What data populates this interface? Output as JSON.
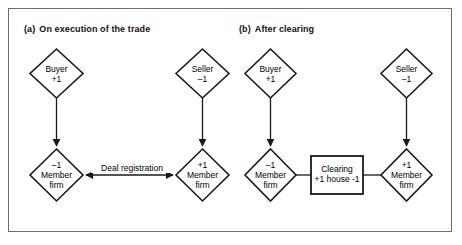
{
  "figure": {
    "width": 462,
    "height": 245,
    "border_color": "#6d6d6d",
    "line_color": "#1a1a1a",
    "background": "#ffffff"
  },
  "panels": [
    {
      "id": "a",
      "tag": "(a)",
      "title": "On execution of the trade",
      "nodes": [
        {
          "id": "buyer",
          "shape": "diamond",
          "line1": "Buyer",
          "line2": "+1"
        },
        {
          "id": "seller",
          "shape": "diamond",
          "line1": "Seller",
          "line2": "–1"
        },
        {
          "id": "buyer_member_firm",
          "shape": "diamond",
          "line1": "–1",
          "line2": "Member",
          "line3": "firm"
        },
        {
          "id": "seller_member_firm",
          "shape": "diamond",
          "line1": "+1",
          "line2": "Member",
          "line3": "firm"
        }
      ],
      "edges": [
        {
          "id": "buyer-to-member",
          "from": "buyer",
          "to": "buyer_member_firm",
          "arrows": "end",
          "label": ""
        },
        {
          "id": "seller-to-member",
          "from": "seller",
          "to": "seller_member_firm",
          "arrows": "end",
          "label": ""
        },
        {
          "id": "deal-registration",
          "from": "buyer_member_firm",
          "to": "seller_member_firm",
          "arrows": "both",
          "label": "Deal registration"
        }
      ]
    },
    {
      "id": "b",
      "tag": "(b)",
      "title": "After clearing",
      "nodes": [
        {
          "id": "buyer",
          "shape": "diamond",
          "line1": "Buyer",
          "line2": "+1"
        },
        {
          "id": "seller",
          "shape": "diamond",
          "line1": "Seller",
          "line2": "–1"
        },
        {
          "id": "buyer_member_firm",
          "shape": "diamond",
          "line1": "–1",
          "line2": "Member",
          "line3": "firm"
        },
        {
          "id": "seller_member_firm",
          "shape": "diamond",
          "line1": "+1",
          "line2": "Member",
          "line3": "firm"
        },
        {
          "id": "clearing_house",
          "shape": "rectangle",
          "line1": "Clearing",
          "line2": "+1 house -1"
        }
      ],
      "edges": [
        {
          "id": "buyer-to-member",
          "from": "buyer",
          "to": "buyer_member_firm",
          "arrows": "end",
          "label": ""
        },
        {
          "id": "seller-to-member",
          "from": "seller",
          "to": "seller_member_firm",
          "arrows": "end",
          "label": ""
        },
        {
          "id": "member-to-clearing-left",
          "from": "buyer_member_firm",
          "to": "clearing_house",
          "arrows": "none",
          "label": ""
        },
        {
          "id": "clearing-to-member-right",
          "from": "clearing_house",
          "to": "seller_member_firm",
          "arrows": "none",
          "label": ""
        }
      ]
    }
  ]
}
